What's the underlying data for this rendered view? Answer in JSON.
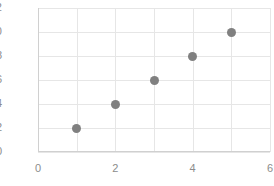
{
  "chart_data": {
    "type": "scatter",
    "title": "",
    "subtitle": "",
    "xlabel": "",
    "ylabel": "",
    "x": [
      1,
      2,
      3,
      4,
      5
    ],
    "values": [
      2,
      4,
      6,
      8,
      10
    ],
    "series": [
      {
        "name": "series-1",
        "x": [
          1,
          2,
          3,
          4,
          5
        ],
        "values": [
          2,
          4,
          6,
          8,
          10
        ],
        "color": "#808080",
        "marker": "circle"
      }
    ],
    "xlim": [
      0,
      6
    ],
    "ylim": [
      0,
      12
    ],
    "xticks": [
      0,
      2,
      4,
      6
    ],
    "yticks": [
      0,
      2,
      4,
      6,
      8,
      10,
      12
    ],
    "xtick_labels": [
      "0",
      "2",
      "4",
      "6"
    ],
    "ytick_labels": [
      "0",
      "2",
      "4",
      "6",
      "8",
      "10",
      "12"
    ],
    "x_gridlines": [
      0,
      1,
      2,
      3,
      4,
      5,
      6
    ],
    "y_gridlines": [
      0,
      2,
      4,
      6,
      8,
      10,
      12
    ],
    "grid": true,
    "legend": false,
    "legend_position": "none",
    "annotations": [],
    "colors": {
      "marker": "#808080",
      "grid": "#e6e6e6",
      "axis": "#d0d0d0",
      "tick_label": "#8c8c8c",
      "background": "#ffffff"
    }
  }
}
